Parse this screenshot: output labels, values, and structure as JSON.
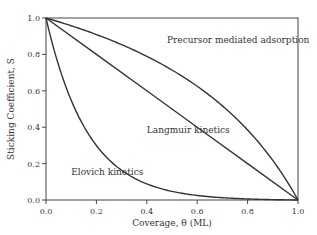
{
  "chart_data": {
    "type": "line",
    "title": "",
    "xlabel": "Coverage,   θ (ML)",
    "ylabel": "Sticking Coefficient, S",
    "xlim": [
      0.0,
      1.0
    ],
    "ylim": [
      0.0,
      1.0
    ],
    "xticks": [
      "0.0",
      "0.2",
      "0.4",
      "0.6",
      "0.8",
      "1.0"
    ],
    "yticks": [
      "0.0",
      "0.2",
      "0.4",
      "0.6",
      "0.8",
      "1.0"
    ],
    "grid": false,
    "legend": "none (inline annotations)",
    "series": [
      {
        "name": "Precursor mediated adsorption",
        "x": [
          0.0,
          0.1,
          0.2,
          0.3,
          0.4,
          0.5,
          0.6,
          0.7,
          0.8,
          0.9,
          1.0
        ],
        "values": [
          1.0,
          0.95,
          0.89,
          0.83,
          0.76,
          0.68,
          0.59,
          0.48,
          0.35,
          0.19,
          0.0
        ]
      },
      {
        "name": "Langmuir kinetics",
        "x": [
          0.0,
          0.2,
          0.4,
          0.6,
          0.8,
          1.0
        ],
        "values": [
          1.0,
          0.8,
          0.6,
          0.4,
          0.2,
          0.0
        ]
      },
      {
        "name": "Elovich kinetics",
        "x": [
          0.0,
          0.1,
          0.2,
          0.3,
          0.4,
          0.5,
          0.6,
          0.7,
          0.8,
          0.9,
          1.0
        ],
        "values": [
          1.0,
          0.56,
          0.33,
          0.2,
          0.12,
          0.08,
          0.05,
          0.03,
          0.02,
          0.01,
          0.0
        ]
      }
    ],
    "annotations": [
      {
        "text": "Precursor mediated adsorption",
        "x": 0.48,
        "y": 0.86
      },
      {
        "text": "Langmuir kinetics",
        "x": 0.4,
        "y": 0.37
      },
      {
        "text": "Elovich kinetics",
        "x": 0.1,
        "y": 0.14
      }
    ]
  }
}
